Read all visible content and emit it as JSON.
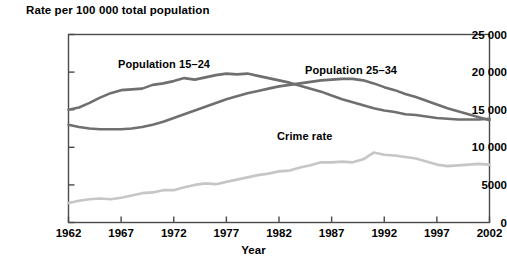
{
  "chart_data": {
    "type": "line",
    "title": "",
    "ylabel": "Rate per 100 000 total population",
    "xlabel": "Year",
    "xlim": [
      1962,
      2002
    ],
    "ylim": [
      0,
      25000
    ],
    "grid": false,
    "legend_position": "inline-annotations",
    "y_ticks": [
      "0",
      "5000",
      "10 000",
      "15 000",
      "20 000",
      "25 000"
    ],
    "y_tick_values": [
      0,
      5000,
      10000,
      15000,
      20000,
      25000
    ],
    "x_ticks": [
      "1962",
      "1967",
      "1972",
      "1977",
      "1982",
      "1987",
      "1992",
      "1997",
      "2002"
    ],
    "x_tick_values": [
      1962,
      1967,
      1972,
      1977,
      1982,
      1987,
      1992,
      1997,
      2002
    ],
    "x": [
      1962,
      1963,
      1964,
      1965,
      1966,
      1967,
      1968,
      1969,
      1970,
      1971,
      1972,
      1973,
      1974,
      1975,
      1976,
      1977,
      1978,
      1979,
      1980,
      1981,
      1982,
      1983,
      1984,
      1985,
      1986,
      1987,
      1988,
      1989,
      1990,
      1991,
      1992,
      1993,
      1994,
      1995,
      1996,
      1997,
      1998,
      1999,
      2000,
      2001,
      2002
    ],
    "series": [
      {
        "name": "Population 15-24",
        "label": "Population 15–24",
        "color": "#6f6f6f",
        "values": [
          15000,
          15300,
          15900,
          16600,
          17200,
          17600,
          17700,
          17800,
          18300,
          18500,
          18800,
          19200,
          19000,
          19300,
          19600,
          19800,
          19700,
          19800,
          19500,
          19200,
          18900,
          18600,
          18200,
          17800,
          17400,
          16900,
          16400,
          16000,
          15600,
          15200,
          14900,
          14700,
          14400,
          14300,
          14100,
          13900,
          13800,
          13700,
          13700,
          13700,
          13800
        ]
      },
      {
        "name": "Population 25-34",
        "label": "Population 25–34",
        "color": "#6f6f6f",
        "values": [
          13000,
          12700,
          12500,
          12400,
          12400,
          12400,
          12500,
          12700,
          13000,
          13400,
          13900,
          14400,
          14900,
          15400,
          15900,
          16400,
          16800,
          17200,
          17500,
          17800,
          18100,
          18300,
          18500,
          18700,
          18900,
          19000,
          19100,
          19100,
          18900,
          18500,
          18000,
          17600,
          17100,
          16700,
          16200,
          15700,
          15200,
          14800,
          14400,
          14000,
          13600
        ]
      },
      {
        "name": "Crime rate",
        "label": "Crime rate",
        "color": "#c6c6c6",
        "values": [
          2600,
          2900,
          3100,
          3200,
          3100,
          3300,
          3600,
          3900,
          4000,
          4300,
          4300,
          4700,
          5000,
          5200,
          5100,
          5400,
          5700,
          6000,
          6300,
          6500,
          6800,
          6900,
          7300,
          7600,
          8000,
          8000,
          8100,
          8000,
          8400,
          9300,
          9000,
          8900,
          8700,
          8500,
          8100,
          7700,
          7500,
          7600,
          7700,
          7800,
          7700
        ]
      }
    ],
    "annotations": [
      {
        "text": "Population 15–24",
        "series": "Population 15-24"
      },
      {
        "text": "Population 25–34",
        "series": "Population 25-34"
      },
      {
        "text": "Crime rate",
        "series": "Crime rate"
      }
    ]
  }
}
